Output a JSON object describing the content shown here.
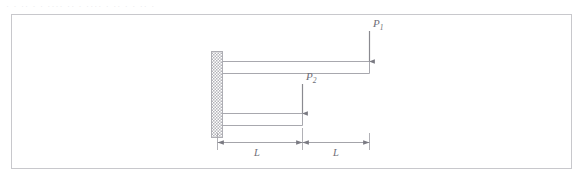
{
  "figure": {
    "type": "cantilever-beam-diagram",
    "clipped_header_text": "· ·   ·· · ·  ····  ·· ·   ····   · ··  · ·   ··  ·",
    "loads": [
      {
        "id": "load-p1",
        "label": "P",
        "subscript": "1",
        "direction": "down"
      },
      {
        "id": "load-p2",
        "label": "P",
        "subscript": "2",
        "direction": "down"
      }
    ],
    "dimensions": [
      {
        "id": "dimension-left",
        "label": "L"
      },
      {
        "id": "dimension-right",
        "label": "L"
      }
    ],
    "support": {
      "id": "fixed-wall-support",
      "style": "hatched"
    },
    "beams": [
      {
        "id": "upper-beam",
        "span": "2L"
      },
      {
        "id": "lower-beam",
        "span": "L"
      }
    ],
    "colors": {
      "panel_border": "#c8c8cc",
      "line": "#9a9aa0",
      "beam_line": "#a8a8ae",
      "arrow": "#8a8a90",
      "hatch": "#b4b4ba",
      "label_text": "#6e6e76",
      "header_text": "#d9d9de"
    }
  }
}
